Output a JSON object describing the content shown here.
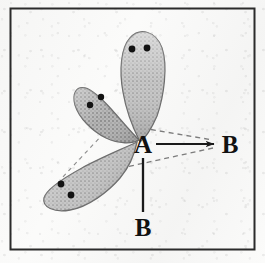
{
  "figure": {
    "title": "Hybrid orbital bonding diagram",
    "border_color": "#2b2b2b",
    "background_color": "#fbfbfa",
    "lobe_fill": "#b9b9b9",
    "lobe_stroke": "#6b6b6b",
    "dot_color": "#111111",
    "bond_color": "#1a1a1a",
    "dashed_color": "#7a7a7a"
  },
  "labels": {
    "center_atom": "A",
    "bond_atom_right": "B",
    "bond_atom_bottom": "B"
  },
  "lobes": [
    {
      "name": "lobe-top",
      "orientation": "up",
      "electron_dots": 2,
      "dot_positions": [
        [
          131,
          48
        ],
        [
          146,
          47
        ]
      ]
    },
    {
      "name": "lobe-upper-left",
      "orientation": "upper-left",
      "electron_dots": 2,
      "dot_positions": [
        [
          90,
          104
        ],
        [
          100,
          97
        ]
      ]
    },
    {
      "name": "lobe-lower-left",
      "orientation": "lower-left",
      "electron_dots": 2,
      "dot_positions": [
        [
          61,
          184
        ],
        [
          71,
          194
        ]
      ]
    }
  ],
  "bonds": [
    {
      "name": "bond-a-to-right-b",
      "style": "solid-arrow",
      "from": "A",
      "to": "B",
      "direction": "right"
    },
    {
      "name": "bond-a-to-bottom-b",
      "style": "solid",
      "from": "A",
      "to": "B",
      "direction": "down"
    }
  ],
  "guides": [
    {
      "name": "guide-top-lobe-to-right-b",
      "style": "dashed"
    },
    {
      "name": "guide-lower-left-to-right-b",
      "style": "dashed"
    },
    {
      "name": "guide-left-lobes-junction",
      "style": "dashed"
    }
  ]
}
